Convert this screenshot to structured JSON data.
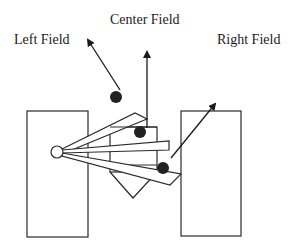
{
  "labels": {
    "left": "Left Field",
    "center": "Center Field",
    "right": "Right Field"
  },
  "colors": {
    "stroke": "#2a2a2a",
    "ball": "#222222",
    "background": "#ffffff"
  },
  "elements": {
    "left_block": {
      "x": 27,
      "y": 111,
      "w": 61,
      "h": 126
    },
    "right_block": {
      "x": 181,
      "y": 111,
      "w": 60,
      "h": 125
    },
    "center_box": {
      "x": 110,
      "y": 127,
      "w": 47,
      "h": 45
    },
    "center_chevron_tip": [
      133,
      198
    ],
    "pivot": {
      "cx": 57,
      "cy": 152,
      "r": 6
    },
    "balls": [
      {
        "name": "left-field-ball",
        "cx": 116,
        "cy": 97,
        "r": 6
      },
      {
        "name": "center-field-ball",
        "cx": 140,
        "cy": 132,
        "r": 6
      },
      {
        "name": "right-field-ball",
        "cx": 163,
        "cy": 168,
        "r": 6
      }
    ],
    "arrows": [
      {
        "name": "left-field-arrow",
        "from": [
          120,
          92
        ],
        "to": [
          87,
          38
        ]
      },
      {
        "name": "center-field-arrow",
        "from": [
          147,
          128
        ],
        "to": [
          147,
          50
        ]
      },
      {
        "name": "right-field-arrow",
        "from": [
          171,
          158
        ],
        "to": [
          216,
          102
        ]
      }
    ]
  }
}
